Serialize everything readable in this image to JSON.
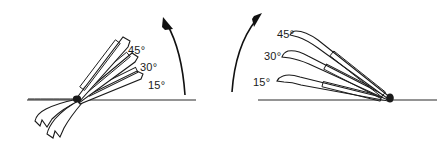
{
  "figure": {
    "background_color": "#ffffff",
    "ink_color": "#1a1a1a",
    "panels": [
      {
        "id": "left-panel",
        "name": "left-view",
        "description": "Blades hinged at pivot on ground line, opening upward to the right",
        "ground_line": {
          "x1": 27,
          "y1": 100,
          "x2": 196,
          "y2": 100
        },
        "pivot": {
          "x": 76,
          "y": 99
        },
        "rotation_arrow": {
          "direction": "counterclockwise-up",
          "path": "M 185,95 C 183,66 176,40 166,22",
          "head_at": {
            "x": 166,
            "y": 22
          }
        },
        "labels": [
          {
            "text": "45°",
            "x": 128,
            "y": 45
          },
          {
            "text": "30°",
            "x": 140,
            "y": 62
          },
          {
            "text": "15°",
            "x": 148,
            "y": 80
          }
        ],
        "blades": [
          {
            "angle_deg": 45,
            "from": {
              "x": 76,
              "y": 99
            },
            "to": {
              "x": 130,
              "y": 39
            }
          },
          {
            "angle_deg": 30,
            "from": {
              "x": 76,
              "y": 99
            },
            "to": {
              "x": 138,
              "y": 56
            }
          },
          {
            "angle_deg": 15,
            "from": {
              "x": 76,
              "y": 99
            },
            "to": {
              "x": 144,
              "y": 74
            }
          }
        ]
      },
      {
        "id": "right-panel",
        "name": "right-view",
        "description": "Blades hinged at pivot on ground line, opening upward to the left",
        "ground_line": {
          "x1": 258,
          "y1": 100,
          "x2": 437,
          "y2": 100
        },
        "pivot": {
          "x": 390,
          "y": 99
        },
        "rotation_arrow": {
          "direction": "clockwise-up",
          "path": "M 232,92 C 234,64 242,38 258,18",
          "head_at": {
            "x": 258,
            "y": 18
          }
        },
        "labels": [
          {
            "text": "45°",
            "x": 277,
            "y": 29
          },
          {
            "text": "30°",
            "x": 264,
            "y": 51
          },
          {
            "text": "15°",
            "x": 253,
            "y": 77
          }
        ],
        "blades": [
          {
            "angle_deg": 45,
            "from": {
              "x": 390,
              "y": 99
            },
            "to": {
              "x": 298,
              "y": 33
            }
          },
          {
            "angle_deg": 30,
            "from": {
              "x": 390,
              "y": 99
            },
            "to": {
              "x": 288,
              "y": 57
            }
          },
          {
            "angle_deg": 15,
            "from": {
              "x": 390,
              "y": 99
            },
            "to": {
              "x": 278,
              "y": 80
            }
          }
        ]
      }
    ]
  }
}
